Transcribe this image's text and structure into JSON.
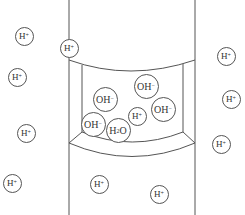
{
  "diagram": {
    "type": "ion-channel-cross-section",
    "colors": {
      "stroke": "#555555",
      "background": "#ffffff",
      "text": "#333333"
    },
    "outside_ions": [
      {
        "id": "h-left-1",
        "base": "H",
        "charge": "+",
        "x": 24,
        "y": 36,
        "size": "small"
      },
      {
        "id": "h-left-2",
        "base": "H",
        "charge": "+",
        "x": 17,
        "y": 77,
        "size": "small"
      },
      {
        "id": "h-left-3",
        "base": "H",
        "charge": "+",
        "x": 26,
        "y": 133,
        "size": "small"
      },
      {
        "id": "h-left-4",
        "base": "H",
        "charge": "+",
        "x": 12,
        "y": 183,
        "size": "small"
      },
      {
        "id": "h-channel-top",
        "base": "H",
        "charge": "+",
        "x": 69,
        "y": 48,
        "size": "small"
      },
      {
        "id": "h-right-1",
        "base": "H",
        "charge": "+",
        "x": 226,
        "y": 56,
        "size": "small"
      },
      {
        "id": "h-right-2",
        "base": "H",
        "charge": "+",
        "x": 231,
        "y": 99,
        "size": "small"
      },
      {
        "id": "h-right-3",
        "base": "H",
        "charge": "+",
        "x": 221,
        "y": 144,
        "size": "small"
      },
      {
        "id": "h-bottom-1",
        "base": "H",
        "charge": "+",
        "x": 99,
        "y": 184,
        "size": "small"
      },
      {
        "id": "h-bottom-2",
        "base": "H",
        "charge": "+",
        "x": 159,
        "y": 194,
        "size": "small"
      }
    ],
    "inner_ions": [
      {
        "id": "oh-1",
        "base": "OH",
        "charge": "−",
        "x": 146,
        "y": 86,
        "size": "large"
      },
      {
        "id": "oh-2",
        "base": "OH",
        "charge": "−",
        "x": 105,
        "y": 99,
        "size": "large"
      },
      {
        "id": "oh-3",
        "base": "OH",
        "charge": "−",
        "x": 163,
        "y": 109,
        "size": "large"
      },
      {
        "id": "h-inner",
        "base": "H",
        "charge": "+",
        "x": 137,
        "y": 116,
        "size": "small"
      },
      {
        "id": "oh-4",
        "base": "OH",
        "charge": "−",
        "x": 93,
        "y": 124,
        "size": "large"
      },
      {
        "id": "h2o",
        "base": "H",
        "sub": "2",
        "suffix": "O",
        "x": 118,
        "y": 130,
        "size": "large"
      }
    ]
  }
}
